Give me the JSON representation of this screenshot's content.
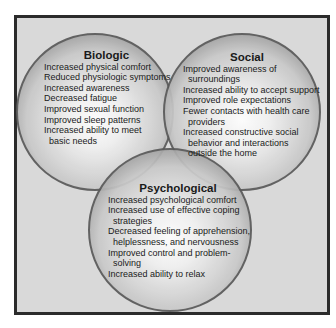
{
  "diagram": {
    "type": "venn",
    "circles": [
      {
        "title": "Biologic",
        "items": [
          "Increased physical comfort",
          "Reduced physiologic symptoms",
          "Increased awareness",
          "Decreased fatigue",
          "Improved sexual function",
          "Improved sleep patterns",
          "Increased ability to meet",
          "basic needs"
        ]
      },
      {
        "title": "Social",
        "items": [
          "Improved awareness of",
          "surroundings",
          "Increased ability to accept support",
          "Improved role expectations",
          "Fewer contacts with health care",
          "providers",
          "Increased constructive social",
          "behavior and interactions",
          "outside the home"
        ]
      },
      {
        "title": "Psychological",
        "items": [
          "Increased psychological comfort",
          "Increased use of effective coping",
          "strategies",
          "Decreased feeling of apprehension,",
          "helplessness, and nervousness",
          "Improved control and problem-",
          "solving",
          "Increased ability to relax"
        ]
      }
    ]
  }
}
